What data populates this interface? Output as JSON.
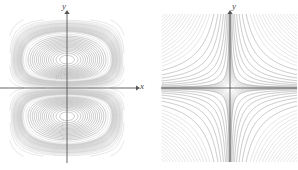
{
  "figure": {
    "width": 298,
    "height": 170,
    "background": "#ffffff",
    "contour_color": "#9a9a9a",
    "contour_color_light": "#c8c8c8",
    "axis_color": "#555555"
  },
  "panels": [
    {
      "id": "left",
      "name": "contour-plot-two-extrema",
      "axes": {
        "x_label": "x",
        "y_label": "y",
        "origin": {
          "x": 67,
          "y": 88
        },
        "x_axis": {
          "x1": 0,
          "x2": 136,
          "arrow": true
        },
        "y_axis": {
          "y1": 163,
          "y2": 14,
          "arrow": true
        },
        "show_box": false
      },
      "extrema": [
        {
          "type": "maximum",
          "x": 67,
          "y": 56
        },
        {
          "type": "maximum",
          "x": 67,
          "y": 120
        }
      ],
      "saddle": {
        "x": 67,
        "y": 88
      },
      "levels": 22
    },
    {
      "id": "right",
      "name": "contour-plot-saddle",
      "axes": {
        "y_label": "y",
        "origin": {
          "x": 230,
          "y": 88
        },
        "x_axis": {
          "x1": 161,
          "x2": 298,
          "arrow": false
        },
        "y_axis": {
          "y1": 162,
          "y2": 14,
          "arrow": true
        },
        "show_box": true,
        "box": {
          "x": 161,
          "y": 14,
          "width": 136,
          "height": 148
        }
      },
      "saddle": {
        "x": 230,
        "y": 88
      },
      "levels": 16
    }
  ],
  "chart_data": [
    {
      "type": "line",
      "subtype": "contour",
      "title": "",
      "xlabel": "x",
      "ylabel": "y",
      "xlim": [
        -3.2,
        3.2
      ],
      "ylim": [
        -3.6,
        3.6
      ],
      "grid": false,
      "legend": null,
      "description": "Contour map with two closed-loop local maxima on the y-axis (one above, one below the origin) and a saddle point at the origin; level curves pinch inward near y=0 and bulge outward near the extrema.",
      "critical_points": [
        {
          "label": "local maximum",
          "x": 0.0,
          "y": 1.4
        },
        {
          "label": "saddle",
          "x": 0.0,
          "y": 0.0
        },
        {
          "label": "local maximum",
          "x": 0.0,
          "y": -1.4
        }
      ],
      "contour_levels": [
        0.05,
        0.12,
        0.2,
        0.28,
        0.36,
        0.44,
        0.52,
        0.6,
        0.68,
        0.76,
        0.84,
        0.92,
        1.0,
        1.08,
        1.16,
        1.24,
        1.32,
        1.4,
        1.48,
        1.56,
        1.64,
        1.72
      ]
    },
    {
      "type": "line",
      "subtype": "contour",
      "title": "",
      "xlabel": "",
      "ylabel": "y",
      "xlim": [
        -2.4,
        2.4
      ],
      "ylim": [
        -2.6,
        2.6
      ],
      "grid": false,
      "legend": null,
      "description": "Contour map of a saddle surface: hyperbola-like level curves opening away from the axes in all four quadrants, with a single saddle point at the origin and the axes acting as the separating level curves.",
      "critical_points": [
        {
          "label": "saddle",
          "x": 0.0,
          "y": 0.0
        }
      ],
      "contour_levels": [
        -1.6,
        -1.2,
        -0.9,
        -0.65,
        -0.45,
        -0.3,
        -0.18,
        -0.08,
        0.08,
        0.18,
        0.3,
        0.45,
        0.65,
        0.9,
        1.2,
        1.6
      ]
    }
  ]
}
